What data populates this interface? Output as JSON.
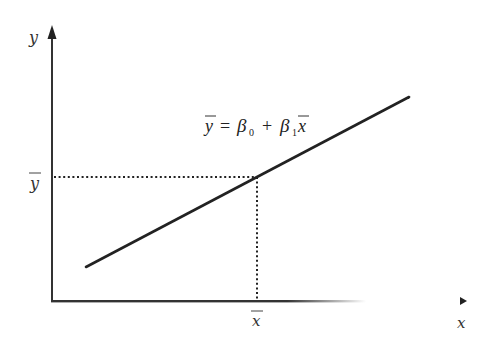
{
  "diagram": {
    "type": "regression-line-diagram",
    "axis_labels": {
      "y": "y",
      "x": "x"
    },
    "mean_labels": {
      "y_bar": "y",
      "x_bar": "x"
    },
    "equation": {
      "lhs": "y",
      "equals": "=",
      "beta0": "β",
      "sub0": "0",
      "plus": "+",
      "beta1": "β",
      "sub1": "1",
      "x": "x"
    },
    "colors": {
      "line": "#222222",
      "axis": "#333333",
      "dots": "#222222"
    }
  }
}
